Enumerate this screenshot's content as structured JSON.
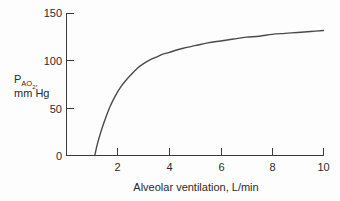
{
  "chart_data": {
    "type": "line",
    "title": "",
    "xlabel": "Alveolar ventilation, L/min",
    "ylabel_line1": "PAO2,",
    "ylabel_line1_main": "P",
    "ylabel_line1_sub_a": "A",
    "ylabel_line1_sub_o": "O",
    "ylabel_line1_sub_2": "2",
    "ylabel_line1_comma": ",",
    "ylabel_line2": "mm Hg",
    "xlim": [
      0,
      10
    ],
    "ylim": [
      0,
      150
    ],
    "xticks": [
      2,
      4,
      6,
      8,
      10
    ],
    "xtick_labels": [
      "2",
      "4",
      "6",
      "8",
      "10"
    ],
    "yticks": [
      0,
      50,
      100,
      150
    ],
    "ytick_labels": [
      "0",
      "50",
      "100",
      "150"
    ],
    "grid": false,
    "legend": "none",
    "series": [
      {
        "name": "Alveolar PO2",
        "x": [
          1.1,
          1.2,
          1.35,
          1.5,
          1.7,
          1.9,
          2.1,
          2.3,
          2.5,
          2.75,
          3.0,
          3.25,
          3.5,
          3.75,
          4.0,
          4.5,
          5.0,
          5.5,
          6.0,
          6.5,
          7.0,
          7.5,
          8.0,
          8.5,
          9.0,
          9.5,
          10.0
        ],
        "y": [
          0,
          12,
          26,
          38,
          52,
          63,
          72,
          79,
          85,
          92,
          97,
          101,
          104,
          107,
          109,
          113,
          116,
          119,
          121,
          123,
          125,
          126,
          128,
          129,
          130,
          131,
          132
        ]
      }
    ]
  },
  "labels": {
    "ytick_0": "0",
    "ytick_50": "50",
    "ytick_100": "100",
    "ytick_150": "150",
    "xtick_2": "2",
    "xtick_4": "4",
    "xtick_6": "6",
    "xtick_8": "8",
    "xtick_10": "10"
  },
  "colors": {
    "curve": "#4a4a4a",
    "axis": "#3a3a3a",
    "text": "#2b2b2b",
    "background": "#fdfdfd"
  }
}
